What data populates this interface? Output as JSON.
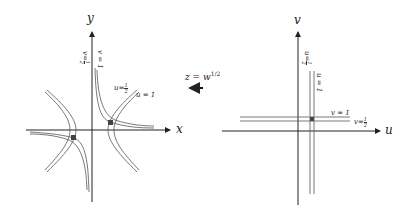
{
  "diagram": {
    "colors": {
      "line": "#333333",
      "curve": "#555555",
      "background": "#ffffff"
    },
    "z_plane": {
      "x_axis_label": "x",
      "y_axis_label": "y",
      "curve_labels": {
        "u_half": {
          "lhs": "u",
          "eq": "=",
          "num": "1",
          "den": "2"
        },
        "u_one": "u = 1",
        "v_half_rot": {
          "lhs": "v",
          "eq": "=",
          "num": "1",
          "den": "2"
        },
        "v_one_rot": "v = 1"
      }
    },
    "mapping": {
      "label_z": "z",
      "label_eq": " = w",
      "label_exp": "1/2",
      "arrow_direction": "left"
    },
    "w_plane": {
      "u_axis_label": "u",
      "v_axis_label": "v",
      "line_labels": {
        "v_one": "v = 1",
        "v_half": {
          "lhs": "v",
          "eq": "=",
          "num": "1",
          "den": "2"
        },
        "u_one_rot": "u = 1",
        "u_half_rot": {
          "lhs": "u",
          "eq": "=",
          "num": "1",
          "den": "2"
        }
      }
    }
  }
}
